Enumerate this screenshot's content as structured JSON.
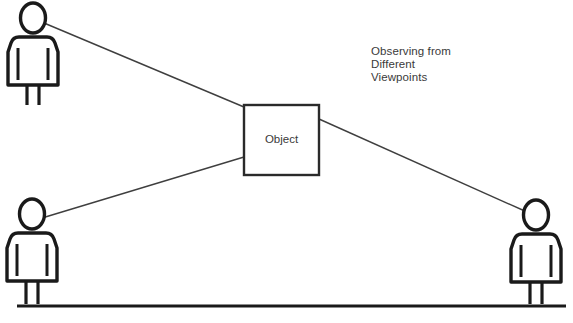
{
  "diagram": {
    "title_annotation": {
      "line1": "Observing from",
      "line2": "Different",
      "line3": "Viewpoints"
    },
    "object": {
      "label": "Object",
      "shape": "rectangle",
      "x": 244,
      "y": 105,
      "width": 75,
      "height": 70
    },
    "observers": [
      {
        "id": "observer-top-left",
        "position": "top-left",
        "head_center_x": 33,
        "head_center_y": 18
      },
      {
        "id": "observer-bottom-left",
        "position": "bottom-left",
        "head_center_x": 32,
        "head_center_y": 214
      },
      {
        "id": "observer-right",
        "position": "bottom-right",
        "head_center_x": 536,
        "head_center_y": 215
      }
    ],
    "sight_lines": [
      {
        "id": "sight-line-top-left",
        "from": "observer-top-left",
        "to": "object-top-left-corner",
        "x1": 44,
        "y1": 23,
        "x2": 244,
        "y2": 107
      },
      {
        "id": "sight-line-bottom-left",
        "from": "observer-bottom-left",
        "to": "object-bottom-left-corner",
        "x1": 42,
        "y1": 218,
        "x2": 244,
        "y2": 157
      },
      {
        "id": "sight-line-right",
        "from": "object-right-edge",
        "to": "observer-right",
        "x1": 319,
        "y1": 119,
        "x2": 527,
        "y2": 212
      }
    ],
    "ground_line": {
      "id": "ground-line",
      "x1": 17,
      "y1": 306,
      "x2": 566,
      "y2": 306
    },
    "colors": {
      "background": "#ffffff",
      "stroke": "#1a1a1a",
      "text": "#3a3a3a",
      "thin_line": "#3f3f3f"
    }
  }
}
